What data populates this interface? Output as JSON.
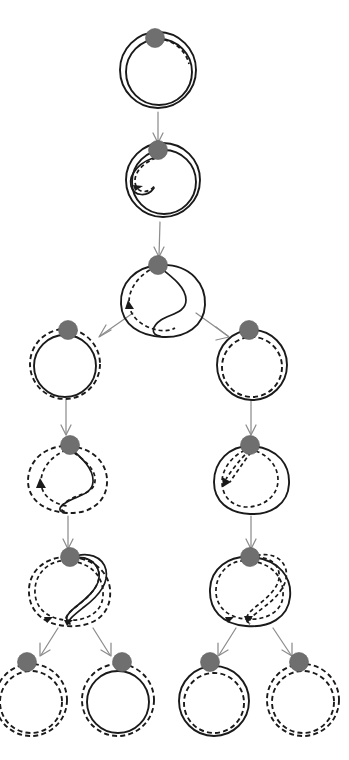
{
  "figure": {
    "width": 349,
    "height": 760,
    "background": "#ffffff",
    "stroke_color": "#1a1a1a",
    "basepoint_color": "#6f6f6f",
    "arrow_color": "#8d8d8d",
    "levels": 7,
    "node_count": 13,
    "edge_count": 12
  },
  "legend": {
    "solid_label": "solid curve",
    "dashed_label": "dashed curve",
    "basepoint_label": "basepoint"
  },
  "nodes": [
    {
      "id": "n0",
      "level": 0,
      "label": "round double loop",
      "cx": 158,
      "cy": 70,
      "r": 38,
      "basepoint": {
        "cx": 155,
        "cy": 38,
        "r": 9
      },
      "curves": [
        {
          "kind": "solid",
          "shape": "circle",
          "r": 38
        },
        {
          "kind": "solid",
          "shape": "circle",
          "r": 33
        },
        {
          "kind": "dashed",
          "shape": "arc-cap",
          "r": 33
        }
      ]
    },
    {
      "id": "n1",
      "level": 1,
      "label": "loop with small inner fold",
      "cx": 163,
      "cy": 178,
      "r": 37,
      "basepoint": {
        "cx": 158,
        "cy": 148,
        "r": 9
      },
      "curves": [
        {
          "kind": "solid",
          "shape": "circle",
          "r": 37
        },
        {
          "kind": "solid",
          "shape": "inner-fold"
        },
        {
          "kind": "dashed",
          "shape": "small-arc-fold"
        }
      ]
    },
    {
      "id": "n2",
      "level": 2,
      "label": "loop with deep S-fold",
      "cx": 161,
      "cy": 295,
      "r": 40,
      "basepoint": {
        "cx": 158,
        "cy": 263,
        "r": 9
      },
      "curves": [
        {
          "kind": "solid",
          "shape": "outer-blob"
        },
        {
          "kind": "solid",
          "shape": "s-fold"
        },
        {
          "kind": "dashed",
          "shape": "s-fold-shadow"
        }
      ]
    },
    {
      "id": "n3",
      "level": 3,
      "label": "solid circle with dashed circle outside",
      "cx": 65,
      "cy": 364,
      "r": 34,
      "basepoint": {
        "cx": 68,
        "cy": 329,
        "r": 9
      },
      "curves": [
        {
          "kind": "solid",
          "shape": "circle",
          "r": 31
        },
        {
          "kind": "dashed",
          "shape": "circle",
          "r": 35
        }
      ]
    },
    {
      "id": "n4",
      "level": 3,
      "label": "solid circle with dashed circle inside",
      "cx": 254,
      "cy": 364,
      "r": 34,
      "basepoint": {
        "cx": 249,
        "cy": 329,
        "r": 9
      },
      "curves": [
        {
          "kind": "solid",
          "shape": "circle",
          "r": 35
        },
        {
          "kind": "dashed",
          "shape": "circle",
          "r": 30
        }
      ]
    },
    {
      "id": "n5",
      "level": 4,
      "label": "dashed loop with solid S-curve",
      "cx": 66,
      "cy": 477,
      "r": 36,
      "basepoint": {
        "cx": 70,
        "cy": 443,
        "r": 9
      },
      "curves": [
        {
          "kind": "dashed",
          "shape": "outer-blob"
        },
        {
          "kind": "dashed",
          "shape": "s-fold-shadow"
        },
        {
          "kind": "solid",
          "shape": "s-fold"
        }
      ]
    },
    {
      "id": "n6",
      "level": 4,
      "label": "solid loop with pinched dashed loop",
      "cx": 254,
      "cy": 477,
      "r": 36,
      "basepoint": {
        "cx": 250,
        "cy": 443,
        "r": 9
      },
      "curves": [
        {
          "kind": "solid",
          "shape": "outer-blob"
        },
        {
          "kind": "dashed",
          "shape": "pinched-loop"
        }
      ]
    },
    {
      "id": "n7",
      "level": 5,
      "label": "dashed loop crossing solid folded loop",
      "cx": 70,
      "cy": 588,
      "r": 38,
      "basepoint": {
        "cx": 70,
        "cy": 556,
        "r": 9
      },
      "curves": [
        {
          "kind": "dashed",
          "shape": "outer-blob"
        },
        {
          "kind": "dashed",
          "shape": "inner-blob"
        },
        {
          "kind": "solid",
          "shape": "tall-fold"
        }
      ]
    },
    {
      "id": "n8",
      "level": 5,
      "label": "solid loop with dashed folded arm",
      "cx": 252,
      "cy": 588,
      "r": 38,
      "basepoint": {
        "cx": 250,
        "cy": 556,
        "r": 9
      },
      "curves": [
        {
          "kind": "solid",
          "shape": "outer-blob"
        },
        {
          "kind": "dashed",
          "shape": "inner-blob"
        },
        {
          "kind": "dashed",
          "shape": "tall-fold"
        }
      ]
    },
    {
      "id": "n9",
      "level": 6,
      "label": "two concentric dashed circles",
      "cx": 31,
      "cy": 700,
      "r": 32,
      "basepoint": {
        "cx": 27,
        "cy": 661,
        "r": 9
      },
      "curves": [
        {
          "kind": "dashed",
          "shape": "circle",
          "r": 31
        },
        {
          "kind": "dashed",
          "shape": "circle",
          "r": 36
        }
      ]
    },
    {
      "id": "n10",
      "level": 6,
      "label": "solid circle with dashed circle outside",
      "cx": 118,
      "cy": 700,
      "r": 32,
      "basepoint": {
        "cx": 122,
        "cy": 661,
        "r": 9
      },
      "curves": [
        {
          "kind": "solid",
          "shape": "circle",
          "r": 31
        },
        {
          "kind": "dashed",
          "shape": "circle",
          "r": 36
        }
      ]
    },
    {
      "id": "n11",
      "level": 6,
      "label": "solid circle with dashed circle inside",
      "cx": 215,
      "cy": 700,
      "r": 32,
      "basepoint": {
        "cx": 210,
        "cy": 661,
        "r": 9
      },
      "curves": [
        {
          "kind": "solid",
          "shape": "circle",
          "r": 35
        },
        {
          "kind": "dashed",
          "shape": "circle",
          "r": 30
        }
      ]
    },
    {
      "id": "n12",
      "level": 6,
      "label": "two concentric dashed circles",
      "cx": 303,
      "cy": 700,
      "r": 32,
      "basepoint": {
        "cx": 299,
        "cy": 661,
        "r": 9
      },
      "curves": [
        {
          "kind": "dashed",
          "shape": "circle",
          "r": 31
        },
        {
          "kind": "dashed",
          "shape": "circle",
          "r": 36
        }
      ]
    }
  ],
  "edges": [
    {
      "id": "e0",
      "from": "n0",
      "to": "n1",
      "x1": 158,
      "y1": 112,
      "x2": 158,
      "y2": 142,
      "label": "step-1"
    },
    {
      "id": "e1",
      "from": "n1",
      "to": "n2",
      "x1": 160,
      "y1": 222,
      "x2": 159,
      "y2": 256,
      "label": "step-2"
    },
    {
      "id": "e2",
      "from": "n2",
      "to": "n3",
      "x1": 130,
      "y1": 312,
      "x2": 98,
      "y2": 335,
      "label": "branch-left"
    },
    {
      "id": "e3",
      "from": "n2",
      "to": "n4",
      "x1": 198,
      "y1": 312,
      "x2": 228,
      "y2": 335,
      "label": "branch-right"
    },
    {
      "id": "e4",
      "from": "n3",
      "to": "n5",
      "x1": 66,
      "y1": 400,
      "x2": 66,
      "y2": 433,
      "label": "step-3L"
    },
    {
      "id": "e5",
      "from": "n4",
      "to": "n6",
      "x1": 251,
      "y1": 400,
      "x2": 251,
      "y2": 433,
      "label": "step-3R"
    },
    {
      "id": "e6",
      "from": "n5",
      "to": "n7",
      "x1": 68,
      "y1": 515,
      "x2": 68,
      "y2": 547,
      "label": "step-4L"
    },
    {
      "id": "e7",
      "from": "n6",
      "to": "n8",
      "x1": 251,
      "y1": 515,
      "x2": 251,
      "y2": 547,
      "label": "step-4R"
    },
    {
      "id": "e8",
      "from": "n7",
      "to": "n9",
      "x1": 60,
      "y1": 626,
      "x2": 40,
      "y2": 654,
      "label": "leaf-1"
    },
    {
      "id": "e9",
      "from": "n7",
      "to": "n10",
      "x1": 92,
      "y1": 626,
      "x2": 110,
      "y2": 654,
      "label": "leaf-2"
    },
    {
      "id": "e10",
      "from": "n8",
      "to": "n11",
      "x1": 237,
      "y1": 626,
      "x2": 219,
      "y2": 654,
      "label": "leaf-3"
    },
    {
      "id": "e11",
      "from": "n8",
      "to": "n12",
      "x1": 272,
      "y1": 626,
      "x2": 291,
      "y2": 654,
      "label": "leaf-4"
    }
  ]
}
